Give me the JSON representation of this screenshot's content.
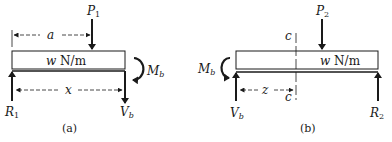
{
  "figure_a": {
    "caption": "(a)",
    "load_label_w": "w",
    "load_label_unit": " N/m",
    "dimension_a": "a",
    "dimension_x": "x",
    "force_P": "P",
    "force_P_sub": "1",
    "reaction_R": "R",
    "reaction_R_sub": "1",
    "shear_V": "V",
    "shear_V_sub": "b",
    "moment_M": "M",
    "moment_M_sub": "b"
  },
  "figure_b": {
    "caption": "(b)",
    "load_label_w": "w",
    "load_label_unit": " N/m",
    "dimension_z": "z",
    "section_top": "c",
    "section_bottom": "c",
    "force_P": "P",
    "force_P_sub": "2",
    "reaction_R": "R",
    "reaction_R_sub": "2",
    "shear_V": "V",
    "shear_V_sub": "b",
    "moment_M": "M",
    "moment_M_sub": "b"
  }
}
